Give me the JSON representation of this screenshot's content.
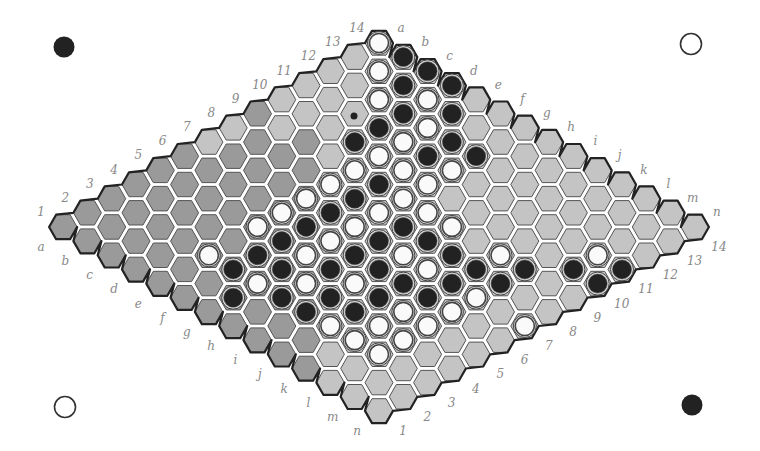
{
  "board": {
    "size": 14,
    "columns": [
      "a",
      "b",
      "c",
      "d",
      "e",
      "f",
      "g",
      "h",
      "i",
      "j",
      "k",
      "l",
      "m",
      "n"
    ],
    "rows": [
      "1",
      "2",
      "3",
      "4",
      "5",
      "6",
      "7",
      "8",
      "9",
      "10",
      "11",
      "12",
      "13",
      "14"
    ],
    "origin": {
      "x": 379,
      "y": 43
    },
    "col_step": {
      "x": 24.3,
      "y": 14.15
    },
    "row_step": {
      "x": -24.3,
      "y": 14.15
    },
    "hex_radius": 14.2,
    "colors": {
      "light_cell": "#c4c4c4",
      "dark_cell": "#9a9a9a",
      "mid_cell": "#a8a8a8",
      "grid_line": "#555555",
      "border": "#222222",
      "black_stone": "#222222",
      "white_stone": "#fafafa",
      "stone_ring": "#444444",
      "label": "#888888"
    }
  },
  "corner_markers": [
    {
      "name": "top-left-black-marker",
      "x": 64,
      "y": 47,
      "color": "black"
    },
    {
      "name": "top-right-white-marker",
      "x": 691,
      "y": 44,
      "color": "white"
    },
    {
      "name": "bottom-left-white-marker",
      "x": 65,
      "y": 407,
      "color": "white"
    },
    {
      "name": "bottom-right-black-marker",
      "x": 692,
      "y": 405,
      "color": "black"
    }
  ],
  "dot_marker": {
    "x": 354,
    "y": 116
  },
  "stones": [
    {
      "d": 0,
      "s": 0,
      "c": "W"
    },
    {
      "d": 0,
      "s": 2,
      "c": "W"
    },
    {
      "d": 0,
      "s": 4,
      "c": "W"
    },
    {
      "d": 0,
      "s": 6,
      "c": "B"
    },
    {
      "d": 0,
      "s": 8,
      "c": "W"
    },
    {
      "d": 0,
      "s": 10,
      "c": "B"
    },
    {
      "d": 0,
      "s": 12,
      "c": "W"
    },
    {
      "d": 0,
      "s": 14,
      "c": "B"
    },
    {
      "d": 0,
      "s": 16,
      "c": "B"
    },
    {
      "d": 0,
      "s": 18,
      "c": "B"
    },
    {
      "d": 0,
      "s": 20,
      "c": "W"
    },
    {
      "d": 0,
      "s": 22,
      "c": "W"
    },
    {
      "d": 1,
      "s": 1,
      "c": "B"
    },
    {
      "d": 1,
      "s": 3,
      "c": "B"
    },
    {
      "d": 1,
      "s": 5,
      "c": "B"
    },
    {
      "d": 1,
      "s": 7,
      "c": "W"
    },
    {
      "d": 1,
      "s": 9,
      "c": "W"
    },
    {
      "d": 1,
      "s": 11,
      "c": "W"
    },
    {
      "d": 1,
      "s": 13,
      "c": "B"
    },
    {
      "d": 1,
      "s": 15,
      "c": "W"
    },
    {
      "d": 1,
      "s": 17,
      "c": "B"
    },
    {
      "d": 1,
      "s": 19,
      "c": "W"
    },
    {
      "d": 1,
      "s": 21,
      "c": "W"
    },
    {
      "d": 2,
      "s": 2,
      "c": "B"
    },
    {
      "d": 2,
      "s": 4,
      "c": "W"
    },
    {
      "d": 2,
      "s": 6,
      "c": "W"
    },
    {
      "d": 2,
      "s": 8,
      "c": "B"
    },
    {
      "d": 2,
      "s": 10,
      "c": "W"
    },
    {
      "d": 2,
      "s": 12,
      "c": "W"
    },
    {
      "d": 2,
      "s": 14,
      "c": "B"
    },
    {
      "d": 2,
      "s": 16,
      "c": "W"
    },
    {
      "d": 2,
      "s": 18,
      "c": "B"
    },
    {
      "d": 2,
      "s": 20,
      "c": "W"
    },
    {
      "d": 3,
      "s": 3,
      "c": "B"
    },
    {
      "d": 3,
      "s": 5,
      "c": "B"
    },
    {
      "d": 3,
      "s": 7,
      "c": "B"
    },
    {
      "d": 3,
      "s": 9,
      "c": "W"
    },
    {
      "d": 3,
      "s": 13,
      "c": "W"
    },
    {
      "d": 3,
      "s": 15,
      "c": "B"
    },
    {
      "d": 3,
      "s": 17,
      "c": "B"
    },
    {
      "d": 3,
      "s": 19,
      "c": "W"
    },
    {
      "d": 4,
      "s": 8,
      "c": "B"
    },
    {
      "d": 4,
      "s": 16,
      "c": "B"
    },
    {
      "d": 4,
      "s": 18,
      "c": "W"
    },
    {
      "d": 5,
      "s": 15,
      "c": "W"
    },
    {
      "d": 5,
      "s": 17,
      "c": "B"
    },
    {
      "d": 6,
      "s": 16,
      "c": "B"
    },
    {
      "d": 6,
      "s": 20,
      "c": "W"
    },
    {
      "d": 8,
      "s": 16,
      "c": "B"
    },
    {
      "d": 9,
      "s": 15,
      "c": "W"
    },
    {
      "d": 9,
      "s": 17,
      "c": "B"
    },
    {
      "d": 9,
      "s": 19,
      "c": "W"
    },
    {
      "d": 10,
      "s": 16,
      "c": "B"
    },
    {
      "d": -1,
      "s": 7,
      "c": "B"
    },
    {
      "d": -1,
      "s": 9,
      "c": "W"
    },
    {
      "d": -1,
      "s": 11,
      "c": "B"
    },
    {
      "d": -1,
      "s": 13,
      "c": "W"
    },
    {
      "d": -1,
      "s": 15,
      "c": "B"
    },
    {
      "d": -1,
      "s": 17,
      "c": "W"
    },
    {
      "d": -1,
      "s": 19,
      "c": "B"
    },
    {
      "d": -1,
      "s": 21,
      "c": "W"
    },
    {
      "d": -2,
      "s": 10,
      "c": "W"
    },
    {
      "d": -2,
      "s": 12,
      "c": "B"
    },
    {
      "d": -2,
      "s": 14,
      "c": "W"
    },
    {
      "d": -2,
      "s": 16,
      "c": "B"
    },
    {
      "d": -2,
      "s": 18,
      "c": "B"
    },
    {
      "d": -2,
      "s": 20,
      "c": "W"
    },
    {
      "d": -3,
      "s": 11,
      "c": "W"
    },
    {
      "d": -3,
      "s": 13,
      "c": "B"
    },
    {
      "d": -3,
      "s": 15,
      "c": "W"
    },
    {
      "d": -3,
      "s": 17,
      "c": "W"
    },
    {
      "d": -3,
      "s": 19,
      "c": "B"
    },
    {
      "d": -4,
      "s": 12,
      "c": "W"
    },
    {
      "d": -4,
      "s": 14,
      "c": "B"
    },
    {
      "d": -4,
      "s": 16,
      "c": "B"
    },
    {
      "d": -4,
      "s": 18,
      "c": "B"
    },
    {
      "d": -5,
      "s": 13,
      "c": "W"
    },
    {
      "d": -5,
      "s": 15,
      "c": "B"
    },
    {
      "d": -5,
      "s": 17,
      "c": "W"
    },
    {
      "d": -6,
      "s": 16,
      "c": "B"
    },
    {
      "d": -6,
      "s": 18,
      "c": "B"
    },
    {
      "d": -7,
      "s": 15,
      "c": "W"
    }
  ],
  "dark_region": "left"
}
